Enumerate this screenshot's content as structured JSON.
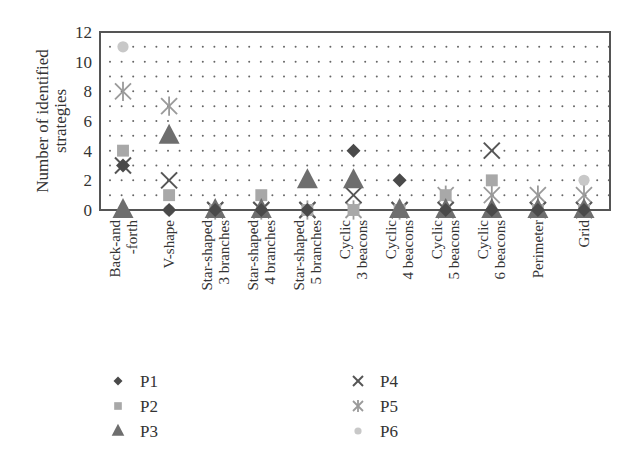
{
  "chart_data": {
    "type": "scatter",
    "title": "",
    "xlabel": "",
    "ylabel": "Number of identified strategies",
    "ylabel_lines": [
      "Number of identified",
      "strategies"
    ],
    "ylim": [
      0,
      12
    ],
    "yticks": [
      0,
      2,
      4,
      6,
      8,
      10,
      12
    ],
    "grid": "dotted, every 1 unit",
    "legend_position": "bottom, two columns",
    "categories": [
      [
        "Back-and",
        "-forth"
      ],
      [
        "V-shape"
      ],
      [
        "Star-shaped",
        "3 branches"
      ],
      [
        "Star-shaped",
        "4 branches"
      ],
      [
        "Star-shaped",
        "5 branches"
      ],
      [
        "Cyclic",
        "3 beacons"
      ],
      [
        "Cyclic",
        "4 beacons"
      ],
      [
        "Cyclic",
        "5 beacons"
      ],
      [
        "Cyclic",
        "6 beacons"
      ],
      [
        "Perimeter"
      ],
      [
        "Grid"
      ]
    ],
    "series": [
      {
        "name": "P1",
        "marker": "diamond",
        "color": "#4a4a4a",
        "values": [
          3,
          0,
          0,
          0,
          0,
          4,
          2,
          0,
          0,
          0,
          0
        ]
      },
      {
        "name": "P2",
        "marker": "square",
        "color": "#a8a8a8",
        "values": [
          4,
          1,
          0,
          1,
          0,
          0,
          0,
          1,
          2,
          0,
          0
        ]
      },
      {
        "name": "P3",
        "marker": "triangle",
        "color": "#6e6e6e",
        "values": [
          0,
          5,
          0,
          0,
          2,
          2,
          0,
          0,
          0,
          0,
          0
        ]
      },
      {
        "name": "P4",
        "marker": "x",
        "color": "#555555",
        "values": [
          3,
          2,
          0,
          0,
          0,
          1,
          0,
          0,
          4,
          0,
          0
        ]
      },
      {
        "name": "P5",
        "marker": "asterisk",
        "color": "#9a9a9a",
        "values": [
          8,
          7,
          0,
          0,
          0,
          0,
          0,
          1,
          1,
          1,
          1
        ]
      },
      {
        "name": "P6",
        "marker": "circle",
        "color": "#c8c8c8",
        "values": [
          11,
          0,
          0,
          0,
          0,
          0,
          0,
          0,
          0,
          0,
          2
        ]
      }
    ]
  },
  "legend": {
    "items": [
      {
        "label": "P1",
        "marker": "diamond"
      },
      {
        "label": "P2",
        "marker": "square"
      },
      {
        "label": "P3",
        "marker": "triangle"
      },
      {
        "label": "P4",
        "marker": "x"
      },
      {
        "label": "P5",
        "marker": "asterisk"
      },
      {
        "label": "P6",
        "marker": "circle"
      }
    ]
  }
}
